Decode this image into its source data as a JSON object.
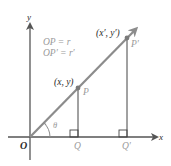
{
  "figure": {
    "axes": {
      "x_label": "x",
      "y_label": "y",
      "origin_label": "O"
    },
    "equations": [
      "OP = r",
      "OP′ = r′"
    ],
    "points": {
      "P": {
        "label": "P",
        "coord_label": "(x, y)"
      },
      "P_prime": {
        "label": "P′",
        "coord_label": "(x′, y′)"
      },
      "Q": {
        "label": "Q"
      },
      "Q_prime": {
        "label": "Q′"
      }
    },
    "angle_label": "θ",
    "colors": {
      "ray": "#8c8c8c",
      "axis": "#555555",
      "point": "#7a7a7a",
      "text_gray": "#9a9a9a",
      "text_dark": "#2a2a2a"
    }
  }
}
